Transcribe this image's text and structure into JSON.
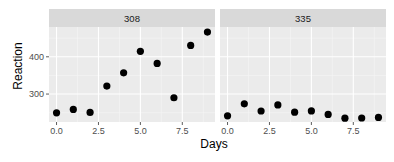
{
  "chart_data": {
    "type": "scatter",
    "title": "",
    "xlabel": "Days",
    "ylabel": "Reaction",
    "facets": [
      {
        "label": "308",
        "x": [
          0,
          1,
          2,
          3,
          4,
          5,
          6,
          7,
          8,
          9
        ],
        "y": [
          249.6,
          258.7,
          250.8,
          321.4,
          356.9,
          414.7,
          382.2,
          290.1,
          430.6,
          466.4
        ]
      },
      {
        "label": "335",
        "x": [
          0,
          1,
          2,
          3,
          4,
          5,
          6,
          7,
          8,
          9
        ],
        "y": [
          241.6,
          273.9,
          254.5,
          270.8,
          251.5,
          254.6,
          245.4,
          235.3,
          235.8,
          237.3
        ]
      }
    ],
    "xlim": [
      -0.45,
      9.45
    ],
    "ylim": [
      225,
      480
    ],
    "x_ticks": [
      "0.0",
      "2.5",
      "5.0",
      "7.5"
    ],
    "y_ticks": [
      "300",
      "400"
    ],
    "grid": true,
    "legend": "none"
  },
  "labels": {
    "x_ticks": [
      "0.0",
      "2.5",
      "5.0",
      "7.5"
    ],
    "y_ticks": [
      "400",
      "300"
    ],
    "facet1": "308",
    "facet2": "335",
    "xlabel": "Days",
    "ylabel": "Reaction"
  }
}
